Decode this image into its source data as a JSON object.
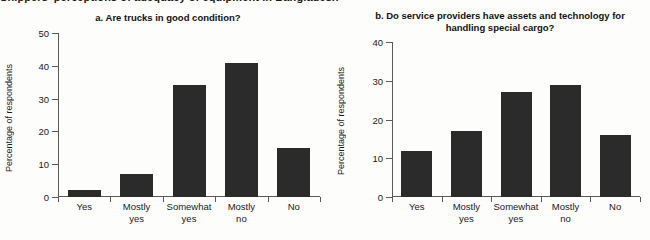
{
  "figure": {
    "caption": "Shippers' perceptions of adequacy of equipment in Bangladesh",
    "bar_color": "#2b2b2b",
    "axis_color": "#5a5a5a",
    "background": "#fdfdfb"
  },
  "chart_data": [
    {
      "type": "bar",
      "title": "a. Are trucks in good condition?",
      "xlabel": "",
      "ylabel": "Percentage of respondents",
      "categories": [
        "Yes",
        "Mostly\nyes",
        "Somewhat\nyes",
        "Mostly\nno",
        "No"
      ],
      "values": [
        2,
        7,
        34,
        41,
        15
      ],
      "ylim": [
        0,
        50
      ],
      "yticks": [
        0,
        10,
        20,
        30,
        40,
        50
      ],
      "ytick_labels": [
        "0",
        "10",
        "20",
        "30",
        "40",
        "50"
      ],
      "grid": false,
      "legend": "none"
    },
    {
      "type": "bar",
      "title": "b. Do service providers have assets and technology for handling special cargo?",
      "xlabel": "",
      "ylabel": "Percentage of respondents",
      "categories": [
        "Yes",
        "Mostly\nyes",
        "Somewhat\nyes",
        "Mostly\nno",
        "No"
      ],
      "values": [
        12,
        17,
        27,
        29,
        16
      ],
      "ylim": [
        0,
        40
      ],
      "yticks": [
        0,
        10,
        20,
        30,
        40
      ],
      "ytick_labels": [
        "0",
        "10",
        "20",
        "30",
        "40"
      ],
      "grid": false,
      "legend": "none"
    }
  ]
}
